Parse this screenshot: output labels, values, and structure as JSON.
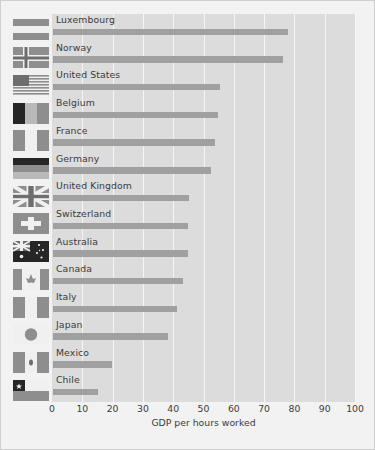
{
  "chart_data": {
    "type": "bar",
    "orientation": "horizontal",
    "title": "",
    "xlabel": "GDP per hours worked",
    "ylabel": "",
    "xlim": [
      0,
      100
    ],
    "xticks": [
      0,
      10,
      20,
      30,
      40,
      50,
      60,
      70,
      80,
      90,
      100
    ],
    "grid": true,
    "legend": "none",
    "categories": [
      "Luxembourg",
      "Norway",
      "United States",
      "Belgium",
      "France",
      "Germany",
      "United Kingdom",
      "Switzerland",
      "Australia",
      "Canada",
      "Italy",
      "Japan",
      "Mexico",
      "Chile"
    ],
    "values": [
      77.5,
      76,
      55,
      54.5,
      53.5,
      52,
      45,
      44.5,
      44.5,
      43,
      41,
      38,
      19.5,
      15
    ],
    "flags": [
      "luxembourg-flag",
      "norway-flag",
      "united-states-flag",
      "belgium-flag",
      "france-flag",
      "germany-flag",
      "united-kingdom-flag",
      "switzerland-flag",
      "australia-flag",
      "canada-flag",
      "italy-flag",
      "japan-flag",
      "mexico-flag",
      "chile-flag"
    ]
  },
  "colors": {
    "panel_background": "#dcdcdc",
    "figure_background": "#f2f2f2",
    "bar": "#a0a0a0",
    "gridline": "#f5f5f5",
    "text": "#3a3a3a"
  }
}
